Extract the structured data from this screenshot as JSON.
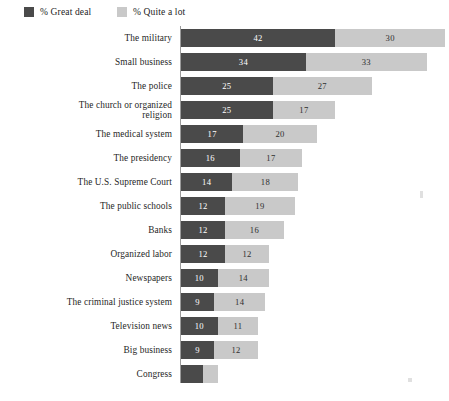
{
  "legend": {
    "items": [
      {
        "label": "% Great deal",
        "color": "#4a4a4a",
        "key": "great_deal"
      },
      {
        "label": "% Quite a lot",
        "color": "#c9c9c9",
        "key": "quite_a_lot"
      }
    ]
  },
  "chart_data": {
    "type": "bar",
    "orientation": "horizontal",
    "stacked": true,
    "title": "",
    "subtitle": "",
    "xlabel": "",
    "ylabel": "",
    "xlim": [
      0,
      72
    ],
    "grid": false,
    "legend_position": "top-left",
    "value_unit": "%",
    "categories": [
      "The military",
      "Small business",
      "The police",
      "The church or organized\nreligion",
      "The medical system",
      "The presidency",
      "The U.S. Supreme Court",
      "The public schools",
      "Banks",
      "Organized labor",
      "Newspapers",
      "The criminal justice system",
      "Television news",
      "Big business",
      "Congress"
    ],
    "series": [
      {
        "name": "% Great deal",
        "color": "#4a4a4a",
        "values": [
          42,
          34,
          25,
          25,
          17,
          16,
          14,
          12,
          12,
          12,
          10,
          9,
          10,
          9,
          6
        ],
        "labels": [
          "42",
          "34",
          "25",
          "25",
          "17",
          "16",
          "14",
          "12",
          "12",
          "12",
          "10",
          "9",
          "10",
          "9",
          ""
        ]
      },
      {
        "name": "% Quite a lot",
        "color": "#c9c9c9",
        "values": [
          30,
          33,
          27,
          17,
          20,
          17,
          18,
          19,
          16,
          12,
          14,
          14,
          11,
          12,
          4
        ],
        "labels": [
          "30",
          "33",
          "27",
          "17",
          "20",
          "17",
          "18",
          "19",
          "16",
          "12",
          "14",
          "14",
          "11",
          "12",
          ""
        ]
      }
    ],
    "totals": [
      72,
      67,
      52,
      42,
      37,
      33,
      32,
      31,
      28,
      24,
      24,
      23,
      21,
      21,
      10
    ]
  }
}
